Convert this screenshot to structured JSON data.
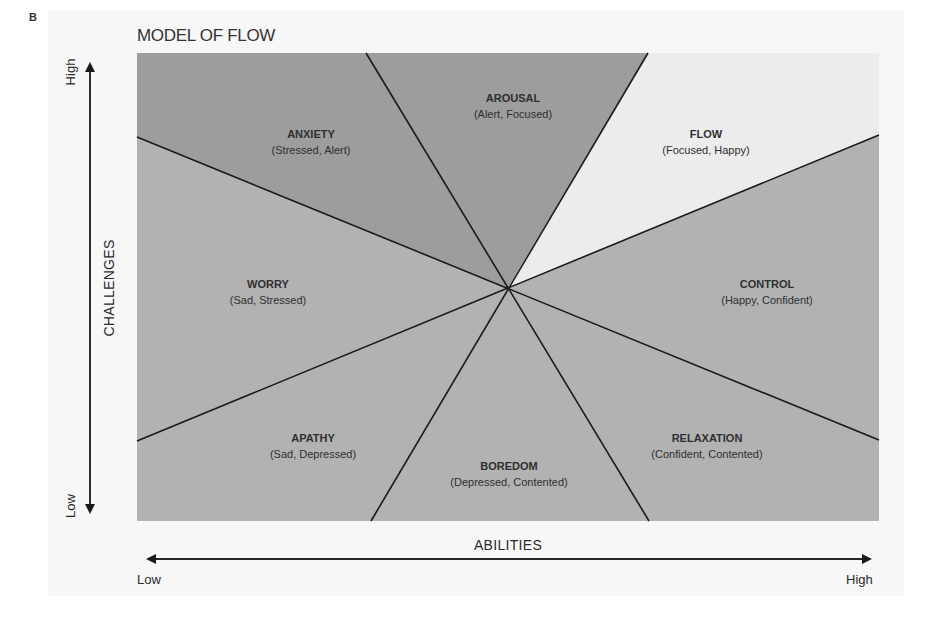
{
  "figure": {
    "panel_letter": "B",
    "title": "MODEL OF FLOW"
  },
  "axes": {
    "y": {
      "title": "CHALLENGES",
      "high": "High",
      "low": "Low"
    },
    "x": {
      "title": "ABILITIES",
      "low": "Low",
      "high": "High"
    }
  },
  "regions": [
    {
      "name": "AROUSAL",
      "feelings": "(Alert, Focused)",
      "shade": "dark"
    },
    {
      "name": "FLOW",
      "feelings": "(Focused, Happy)",
      "shade": "light"
    },
    {
      "name": "CONTROL",
      "feelings": "(Happy, Confident)",
      "shade": "medium"
    },
    {
      "name": "RELAXATION",
      "feelings": "(Confident, Contented)",
      "shade": "medium"
    },
    {
      "name": "BOREDOM",
      "feelings": "(Depressed, Contented)",
      "shade": "medium"
    },
    {
      "name": "APATHY",
      "feelings": "(Sad, Depressed)",
      "shade": "medium"
    },
    {
      "name": "WORRY",
      "feelings": "(Sad, Stressed)",
      "shade": "medium"
    },
    {
      "name": "ANXIETY",
      "feelings": "(Stressed, Alert)",
      "shade": "dark"
    }
  ],
  "colors": {
    "dark": "#9d9d9d",
    "medium": "#b2b2b2",
    "light": "#ececec",
    "line": "#1a1a1a"
  }
}
